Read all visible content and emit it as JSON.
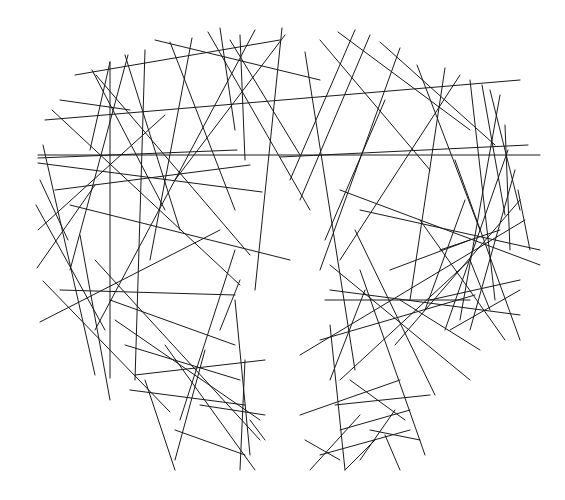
{
  "artwork": {
    "title": "Line art shield with central figure cut-out",
    "background": "#ffffff",
    "stroke_color": "#1a1a1a",
    "stroke_width": 1,
    "width": 565,
    "height": 500,
    "lines": [
      [
        43,
        145,
        95,
        375
      ],
      [
        38,
        163,
        262,
        192
      ],
      [
        38,
        158,
        237,
        150
      ],
      [
        40,
        180,
        68,
        240
      ],
      [
        36,
        205,
        105,
        330
      ],
      [
        38,
        230,
        165,
        115
      ],
      [
        37,
        268,
        95,
        185
      ],
      [
        40,
        322,
        220,
        230
      ],
      [
        43,
        281,
        170,
        412
      ],
      [
        52,
        110,
        240,
        285
      ],
      [
        60,
        100,
        130,
        110
      ],
      [
        75,
        75,
        280,
        40
      ],
      [
        92,
        70,
        165,
        210
      ],
      [
        96,
        75,
        250,
        255
      ],
      [
        110,
        62,
        110,
        378
      ],
      [
        110,
        62,
        90,
        150
      ],
      [
        125,
        55,
        180,
        230
      ],
      [
        128,
        55,
        70,
        270
      ],
      [
        145,
        50,
        135,
        380
      ],
      [
        155,
        40,
        320,
        80
      ],
      [
        170,
        42,
        235,
        210
      ],
      [
        192,
        38,
        150,
        260
      ],
      [
        208,
        32,
        310,
        210
      ],
      [
        220,
        28,
        235,
        130
      ],
      [
        230,
        40,
        300,
        155
      ],
      [
        240,
        35,
        245,
        160
      ],
      [
        255,
        30,
        95,
        330
      ],
      [
        285,
        35,
        175,
        180
      ],
      [
        282,
        28,
        255,
        290
      ],
      [
        305,
        52,
        355,
        370
      ],
      [
        320,
        40,
        430,
        170
      ],
      [
        338,
        32,
        470,
        130
      ],
      [
        355,
        30,
        290,
        180
      ],
      [
        370,
        35,
        300,
        200
      ],
      [
        380,
        42,
        495,
        145
      ],
      [
        400,
        48,
        320,
        270
      ],
      [
        417,
        65,
        480,
        230
      ],
      [
        445,
        68,
        410,
        300
      ],
      [
        460,
        75,
        340,
        260
      ],
      [
        470,
        80,
        495,
        300
      ],
      [
        482,
        85,
        505,
        215
      ],
      [
        490,
        90,
        520,
        210
      ],
      [
        500,
        95,
        460,
        320
      ],
      [
        505,
        125,
        510,
        250
      ],
      [
        508,
        150,
        445,
        330
      ],
      [
        515,
        170,
        470,
        330
      ],
      [
        518,
        190,
        530,
        250
      ],
      [
        520,
        200,
        395,
        345
      ],
      [
        525,
        220,
        300,
        355
      ],
      [
        280,
        157,
        528,
        145
      ],
      [
        38,
        155,
        540,
        155
      ],
      [
        45,
        120,
        520,
        80
      ],
      [
        55,
        190,
        250,
        165
      ],
      [
        60,
        290,
        235,
        295
      ],
      [
        70,
        205,
        290,
        260
      ],
      [
        80,
        235,
        110,
        400
      ],
      [
        95,
        260,
        260,
        440
      ],
      [
        110,
        300,
        235,
        345
      ],
      [
        115,
        320,
        260,
        420
      ],
      [
        125,
        345,
        240,
        380
      ],
      [
        130,
        390,
        245,
        405
      ],
      [
        135,
        375,
        265,
        360
      ],
      [
        145,
        380,
        175,
        470
      ],
      [
        165,
        345,
        255,
        470
      ],
      [
        175,
        430,
        245,
        455
      ],
      [
        200,
        405,
        265,
        415
      ],
      [
        205,
        350,
        175,
        460
      ],
      [
        235,
        250,
        180,
        420
      ],
      [
        235,
        300,
        250,
        455
      ],
      [
        240,
        280,
        220,
        330
      ],
      [
        245,
        360,
        240,
        470
      ],
      [
        250,
        420,
        265,
        440
      ],
      [
        330,
        265,
        470,
        380
      ],
      [
        330,
        290,
        520,
        315
      ],
      [
        325,
        300,
        470,
        300
      ],
      [
        320,
        340,
        475,
        295
      ],
      [
        330,
        325,
        345,
        470
      ],
      [
        335,
        405,
        430,
        395
      ],
      [
        340,
        380,
        470,
        260
      ],
      [
        340,
        430,
        410,
        410
      ],
      [
        350,
        380,
        405,
        420
      ],
      [
        355,
        230,
        435,
        395
      ],
      [
        360,
        270,
        425,
        455
      ],
      [
        365,
        290,
        330,
        380
      ],
      [
        360,
        210,
        540,
        250
      ],
      [
        340,
        190,
        540,
        265
      ],
      [
        385,
        100,
        325,
        240
      ],
      [
        390,
        270,
        470,
        240
      ],
      [
        300,
        415,
        400,
        380
      ],
      [
        305,
        440,
        340,
        460
      ],
      [
        310,
        470,
        360,
        415
      ],
      [
        320,
        455,
        410,
        430
      ],
      [
        345,
        470,
        375,
        440
      ],
      [
        360,
        460,
        395,
        410
      ],
      [
        370,
        430,
        420,
        440
      ],
      [
        385,
        435,
        400,
        470
      ],
      [
        420,
        220,
        505,
        340
      ],
      [
        430,
        300,
        520,
        280
      ],
      [
        440,
        250,
        500,
        230
      ],
      [
        450,
        330,
        520,
        290
      ],
      [
        455,
        160,
        520,
        340
      ],
      [
        465,
        200,
        425,
        310
      ],
      [
        470,
        260,
        490,
        310
      ],
      [
        480,
        350,
        400,
        300
      ]
    ]
  }
}
